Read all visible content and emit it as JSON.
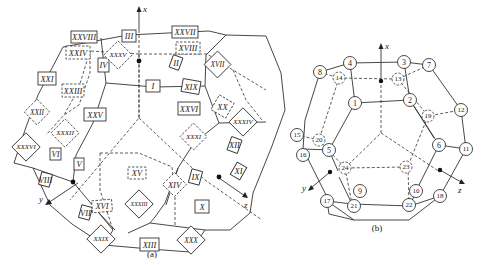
{
  "figure_a": {
    "caption": "(a)",
    "axes": {
      "x": "x",
      "y": "y",
      "z": "z"
    },
    "face_labels": {
      "solid_box": [
        "I",
        "III",
        "IV",
        "XXV",
        "XXI",
        "XXVIII",
        "XXVII",
        "II",
        "XIX",
        "XXVI",
        "VI",
        "V",
        "VIII",
        "XIII",
        "IX",
        "X",
        "XI",
        "XII"
      ],
      "dashed_box": [
        "XXIV",
        "XXIII",
        "XVIII",
        "XV",
        "XVI"
      ],
      "solid_diamond": [
        "XXXVI",
        "XVII",
        "XXXIV",
        "XXIX",
        "XXXIII",
        "XXX"
      ],
      "dashed_diamond": [
        "XXXV",
        "XXII",
        "XXXII",
        "XX",
        "XXXI",
        "XIV"
      ]
    }
  },
  "figure_b": {
    "caption": "(b)",
    "axes": {
      "x": "x",
      "y": "y",
      "z": "z"
    },
    "visible_nodes": [
      "1",
      "2",
      "3",
      "4",
      "5",
      "6",
      "7",
      "8",
      "9",
      "10",
      "11",
      "12",
      "15",
      "16",
      "17",
      "18",
      "21",
      "22"
    ],
    "hidden_nodes": [
      "13",
      "14",
      "19",
      "20",
      "23",
      "24"
    ]
  }
}
